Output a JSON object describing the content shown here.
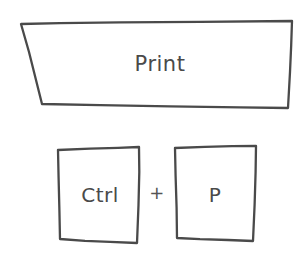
{
  "diagram": {
    "title": "Print",
    "shapes": {
      "banner": {
        "name": "print-banner",
        "shape": "trapezoid",
        "label": "Print",
        "points": "21,24 292,21 288,108 42,104"
      },
      "key_ctrl": {
        "name": "key-ctrl",
        "shape": "square",
        "label": "Ctrl",
        "points": "58,150 139,147 137,243 60,239"
      },
      "key_p": {
        "name": "key-p",
        "shape": "square",
        "label": "P",
        "points": "175,148 256,146 253,241 177,238"
      }
    },
    "connector": {
      "name": "plus-sign",
      "label": "+"
    },
    "colors": {
      "stroke": "#4a4a4a",
      "background": "#ffffff",
      "text": "#4a4a4a"
    }
  }
}
